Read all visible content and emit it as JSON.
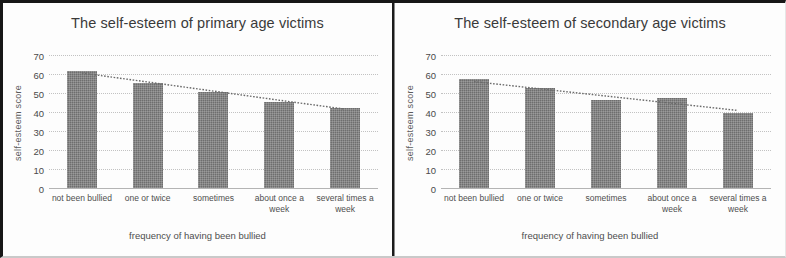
{
  "chart_data": [
    {
      "type": "bar",
      "title": "The self-esteem of primary age victims",
      "xlabel": "frequency of having been bullied",
      "ylabel": "self-esteem score",
      "categories": [
        "not been bullied",
        "one or twice",
        "sometimes",
        "about once a week",
        "several times a week"
      ],
      "values": [
        61.5,
        55.5,
        50.5,
        45.5,
        42
      ],
      "ylim": [
        0,
        70
      ],
      "yticks": [
        "0",
        "10",
        "20",
        "30",
        "40",
        "50",
        "60",
        "70"
      ],
      "grid": true,
      "legend": "none",
      "bar_color": "#6e6e6e",
      "series": [
        {
          "name": "self-esteem score",
          "values": [
            61.5,
            55.5,
            50.5,
            45.5,
            42
          ]
        },
        {
          "name": "linear trendline",
          "type": "line",
          "style": "dotted",
          "values": [
            60.5,
            55.8,
            51.0,
            46.2,
            41.5
          ]
        }
      ]
    },
    {
      "type": "bar",
      "title": "The self-esteem of secondary age victims",
      "xlabel": "frequency of having been bullied",
      "ylabel": "self-esteem score",
      "categories": [
        "not been bullied",
        "one or twice",
        "sometimes",
        "about once a week",
        "several times a week"
      ],
      "values": [
        57.5,
        52.5,
        46.5,
        47.5,
        39.5
      ],
      "ylim": [
        0,
        70
      ],
      "yticks": [
        "0",
        "10",
        "20",
        "30",
        "40",
        "50",
        "60",
        "70"
      ],
      "grid": true,
      "legend": "none",
      "bar_color": "#6e6e6e",
      "series": [
        {
          "name": "self-esteem score",
          "values": [
            57.5,
            52.5,
            46.5,
            47.5,
            39.5
          ]
        },
        {
          "name": "linear trendline",
          "type": "line",
          "style": "dotted",
          "values": [
            56.0,
            52.2,
            48.4,
            44.6,
            40.8
          ]
        }
      ]
    }
  ],
  "figure": {
    "panel_count": 2,
    "background": "#fdfdfd"
  }
}
